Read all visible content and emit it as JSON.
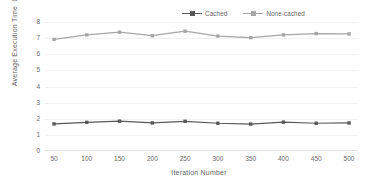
{
  "chart": {
    "type": "line",
    "title": "",
    "xlabel": "Iteration Number",
    "ylabel": "Average Execution Time（s）"
  },
  "legend": {
    "position": "top-right",
    "items": [
      {
        "label": "Cached",
        "color": "#595959",
        "marker": "square"
      },
      {
        "label": "None-cached",
        "color": "#a6a6a6",
        "marker": "square"
      }
    ]
  },
  "axes": {
    "y_ticks": [
      "8",
      "7",
      "6",
      "5",
      "4",
      "3",
      "2",
      "1",
      "0"
    ],
    "x_ticks": [
      "50",
      "100",
      "150",
      "200",
      "250",
      "300",
      "350",
      "400",
      "450",
      "500"
    ],
    "ylim": [
      0,
      8
    ],
    "grid": "horizontal-faint"
  },
  "chart_data": {
    "type": "line",
    "title": "",
    "xlabel": "Iteration Number",
    "ylabel": "Average Execution Time（s）",
    "categories": [
      50,
      100,
      150,
      200,
      250,
      300,
      350,
      400,
      450,
      500
    ],
    "series": [
      {
        "name": "Cached",
        "color": "#595959",
        "values": [
          1.68,
          1.78,
          1.85,
          1.74,
          1.84,
          1.72,
          1.67,
          1.79,
          1.72,
          1.74
        ]
      },
      {
        "name": "None-cached",
        "color": "#a6a6a6",
        "values": [
          6.92,
          7.2,
          7.37,
          7.15,
          7.43,
          7.13,
          7.03,
          7.2,
          7.28,
          7.26
        ]
      }
    ],
    "ylim": [
      0,
      8
    ],
    "ytick_step": 1,
    "grid": true,
    "legend_position": "top-right"
  }
}
